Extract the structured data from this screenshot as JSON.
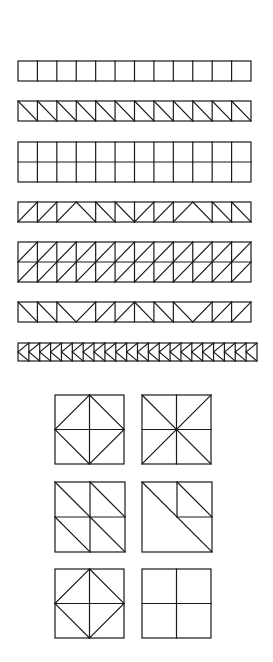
{
  "figure": {
    "title": "",
    "stroke_color": "#1a1a1a",
    "background": "#ffffff",
    "strips": [
      {
        "id": "strip-plain",
        "rows": 1,
        "cols": 12,
        "cells": [
          "empty",
          "empty",
          "empty",
          "empty",
          "empty",
          "empty",
          "empty",
          "empty",
          "empty",
          "empty",
          "empty",
          "empty"
        ]
      },
      {
        "id": "strip-backslash",
        "rows": 1,
        "cols": 12,
        "cells": [
          "back",
          "back",
          "back",
          "back",
          "back",
          "back",
          "back",
          "back",
          "back",
          "back",
          "back",
          "back"
        ]
      },
      {
        "id": "strip-double-plain",
        "rows": 2,
        "cols": 12,
        "cells": [
          "empty"
        ]
      },
      {
        "id": "strip-peaks",
        "rows": 1,
        "cols": 12,
        "cells": [
          "fwd",
          "fwd",
          "peak-left",
          "peak-right",
          "back",
          "back",
          "fwd",
          "fwd",
          "peak-left",
          "peak-right",
          "back",
          "back"
        ],
        "merged_pairs": [
          [
            3,
            4
          ],
          [
            9,
            10
          ]
        ]
      },
      {
        "id": "strip-double-forward",
        "rows": 2,
        "cols": 12,
        "cells": [
          "fwd"
        ]
      },
      {
        "id": "strip-valleys",
        "rows": 1,
        "cols": 12,
        "cells": [
          "back",
          "back",
          "valley-left",
          "valley-right",
          "fwd",
          "fwd",
          "back",
          "back",
          "valley-left",
          "valley-right",
          "fwd",
          "fwd"
        ],
        "merged_pairs": [
          [
            3,
            4
          ],
          [
            9,
            10
          ]
        ]
      },
      {
        "id": "strip-chevrons",
        "rows": 1,
        "cols": 22,
        "cells": [
          "chevron-left"
        ]
      }
    ],
    "blocks": [
      {
        "id": "block-cross-diamond-1",
        "pattern": "cross-diamond"
      },
      {
        "id": "block-cross-x",
        "pattern": "cross-x"
      },
      {
        "id": "block-quad-diagonals",
        "pattern": "quad-backslash"
      },
      {
        "id": "block-diagonal-with-corner",
        "pattern": "diag-corner"
      },
      {
        "id": "block-cross-diamond-2",
        "pattern": "cross-diamond"
      },
      {
        "id": "block-cross",
        "pattern": "cross"
      }
    ]
  }
}
